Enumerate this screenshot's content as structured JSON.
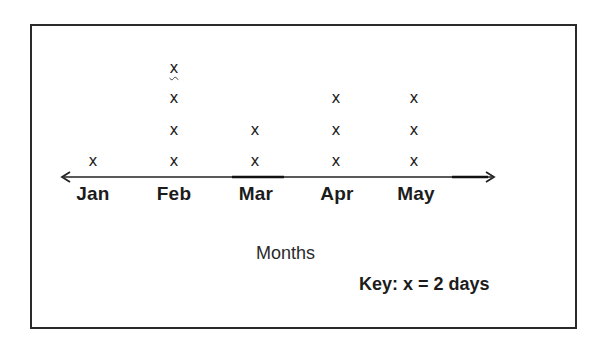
{
  "chart_data": {
    "type": "dot_plot",
    "title": "",
    "xlabel": "Months",
    "ylabel": "",
    "categories": [
      "Jan",
      "Feb",
      "Mar",
      "Apr",
      "May"
    ],
    "marker_counts": [
      1,
      4,
      2,
      3,
      3
    ],
    "values": [
      2,
      8,
      4,
      6,
      6
    ],
    "unit": "days",
    "marker_symbol": "x",
    "key": "Key: x = 2 days",
    "legend_position": "bottom-right",
    "grid": false
  },
  "labels": {
    "marker": "x",
    "months": [
      "Jan",
      "Feb",
      "Mar",
      "Apr",
      "May"
    ],
    "xlabel": "Months",
    "key": "Key: x = 2 days"
  }
}
